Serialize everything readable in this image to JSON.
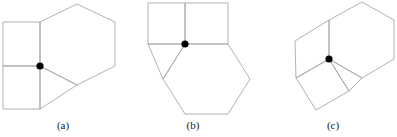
{
  "figure": {
    "type": "geometric-tiling-diagram",
    "stroke_color": "#a8a8a8",
    "vertex_color": "#000000",
    "background_color": "#ffffff",
    "panels": [
      {
        "id": "a",
        "label": "(a)",
        "marked_vertex": {
          "x": 40,
          "y": 66
        },
        "shapes": [
          {
            "name": "hexagon",
            "sides": 6,
            "points": "40,66 40,22 77,4 115,22 115,66 77,85"
          },
          {
            "name": "square-upper",
            "sides": 4,
            "points": "40,66 40,22 3,22 3,66"
          },
          {
            "name": "square-lower",
            "sides": 4,
            "points": "40,66 3,66 3,109 40,109"
          },
          {
            "name": "triangle",
            "sides": 3,
            "points": "40,66 40,109 77,85"
          }
        ]
      },
      {
        "id": "b",
        "label": "(b)",
        "marked_vertex": {
          "x": 185,
          "y": 44
        },
        "shapes": [
          {
            "name": "hexagon",
            "sides": 6,
            "points": "185,44 228,44 250,79 228,114 185,114 163,79"
          },
          {
            "name": "square-left",
            "sides": 4,
            "points": "185,44 185,3 148,3 148,44"
          },
          {
            "name": "square-right",
            "sides": 4,
            "points": "185,44 185,3 228,3 228,44"
          },
          {
            "name": "triangle",
            "sides": 3,
            "points": "185,44 148,44 163,79"
          }
        ]
      },
      {
        "id": "c",
        "label": "(c)",
        "marked_vertex": {
          "x": 329,
          "y": 59
        },
        "shapes": [
          {
            "name": "hexagon",
            "sides": 6,
            "points": "329,59 329,20 362,2 394,20 394,59 362,78"
          },
          {
            "name": "square-upper",
            "sides": 4,
            "points": "329,59 329,20 295,41 296,78"
          },
          {
            "name": "square-lower",
            "sides": 4,
            "points": "329,59 296,78 316,110 349,91"
          },
          {
            "name": "triangle",
            "sides": 3,
            "points": "329,59 349,91 362,78"
          }
        ]
      }
    ]
  }
}
